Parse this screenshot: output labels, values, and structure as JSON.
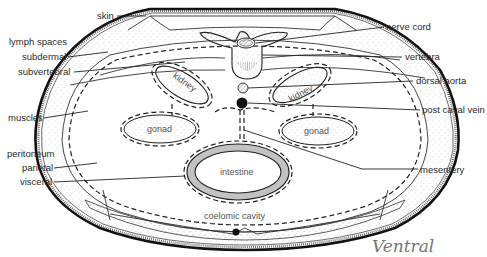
{
  "figure": {
    "orientation_note": "Ventral"
  },
  "labels": {
    "left": [
      {
        "id": "skin",
        "text": "skin"
      },
      {
        "id": "lymph_spaces",
        "text": "lymph spaces"
      },
      {
        "id": "subdermal",
        "text": "subdermal"
      },
      {
        "id": "subvertebral",
        "text": "subvertebral"
      },
      {
        "id": "muscles",
        "text": "muscles"
      },
      {
        "id": "peritoneum",
        "text": "peritoneum"
      },
      {
        "id": "parietal",
        "text": "parietal"
      },
      {
        "id": "visceral",
        "text": "visceral"
      }
    ],
    "right": [
      {
        "id": "nerve_cord",
        "text": "nerve cord"
      },
      {
        "id": "vertebra",
        "text": "vertebra"
      },
      {
        "id": "dorsal_aorta",
        "text": "dorsal aorta"
      },
      {
        "id": "post_caval_vein",
        "text": "post caval vein"
      },
      {
        "id": "mesentery",
        "text": "mesentery"
      }
    ],
    "inner": {
      "kidney_left": "kidney",
      "kidney_right": "kidney",
      "gonad_left": "gonad",
      "gonad_right": "gonad",
      "intestine": "intestine",
      "coelomic_cavity": "coelomic cavity"
    }
  },
  "colors": {
    "ink": "#222222",
    "stipple": "#9a9a9a",
    "background": "#ffffff",
    "handwriting": "#777777"
  }
}
